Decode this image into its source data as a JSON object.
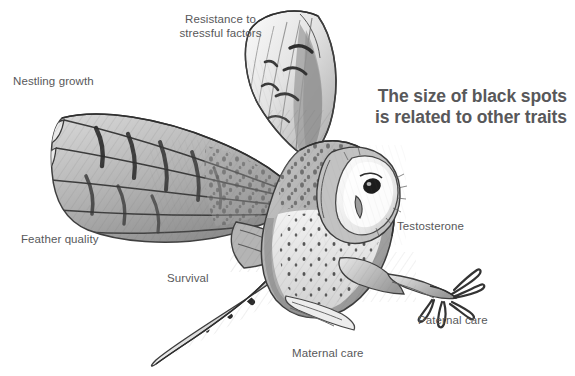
{
  "figure": {
    "title": "The size of black spots\nis related to other traits",
    "background_color": "#ffffff",
    "label_color": "#58585a",
    "title_color": "#58585a",
    "illustration": {
      "subject": "barn owl in flight, pencil sketch, grayscale",
      "name": "owl-illustration"
    },
    "labels": [
      {
        "id": "resistance",
        "text": "Resistance to\nstressful factors"
      },
      {
        "id": "nestling",
        "text": "Nestling growth"
      },
      {
        "id": "feather",
        "text": "Feather quality"
      },
      {
        "id": "survival",
        "text": "Survival"
      },
      {
        "id": "testosterone",
        "text": "Testosterone"
      },
      {
        "id": "paternal",
        "text": "Paternal care"
      },
      {
        "id": "maternal",
        "text": "Maternal care"
      }
    ]
  }
}
